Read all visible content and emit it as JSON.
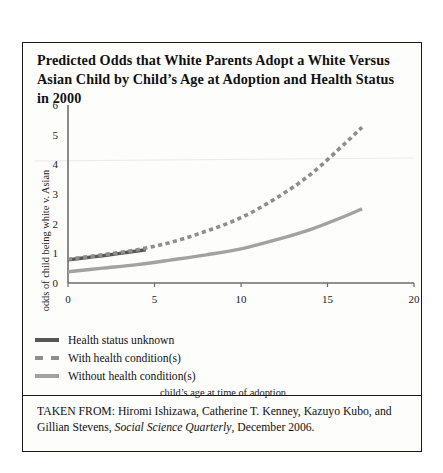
{
  "title": "Predicted Odds that White Parents Adopt a White Versus Asian Child by Child’s Age at Adoption and Health Status in 2000",
  "source": {
    "prefix": "TAKEN FROM: Hiromi Ishizawa, Catherine T. Kenney, Kazuyo Kubo, and Gillian Stevens, ",
    "journal": "Social Science Quarterly",
    "suffix": ", December 2006."
  },
  "legend": {
    "items": [
      {
        "label": "Health status unknown",
        "style": "solid",
        "color": "#575757"
      },
      {
        "label": "With health condition(s)",
        "style": "dashed",
        "color": "#8e8e8e"
      },
      {
        "label": "Without health condition(s)",
        "style": "solid",
        "color": "#a2a2a2"
      }
    ]
  },
  "chart_data": {
    "type": "line",
    "title": "",
    "xlabel": "child’s age at time of adoption",
    "ylabel": "odds of child being white v. Asian",
    "xlim": [
      0,
      20
    ],
    "ylim": [
      0,
      6
    ],
    "xticks": [
      0,
      5,
      10,
      15,
      20
    ],
    "yticks": [
      0,
      1,
      2,
      3,
      4,
      5,
      6
    ],
    "grid": false,
    "legend_position": "below-plot-left",
    "series": [
      {
        "name": "Health status unknown",
        "color": "#575757",
        "style": "solid",
        "x": [
          0,
          1,
          2,
          3,
          4,
          4.5
        ],
        "y": [
          0.78,
          0.85,
          0.92,
          1.0,
          1.08,
          1.12
        ]
      },
      {
        "name": "With health condition(s)",
        "color": "#8e8e8e",
        "style": "dashed",
        "x": [
          0,
          2,
          4,
          6,
          8,
          10,
          12,
          14,
          16,
          17
        ],
        "y": [
          0.8,
          0.95,
          1.12,
          1.38,
          1.75,
          2.2,
          2.85,
          3.65,
          4.7,
          5.25
        ]
      },
      {
        "name": "Without health condition(s)",
        "color": "#a2a2a2",
        "style": "solid",
        "x": [
          0,
          2,
          4,
          6,
          8,
          10,
          12,
          14,
          16,
          17
        ],
        "y": [
          0.38,
          0.5,
          0.62,
          0.78,
          0.95,
          1.15,
          1.45,
          1.8,
          2.25,
          2.5
        ]
      }
    ]
  }
}
